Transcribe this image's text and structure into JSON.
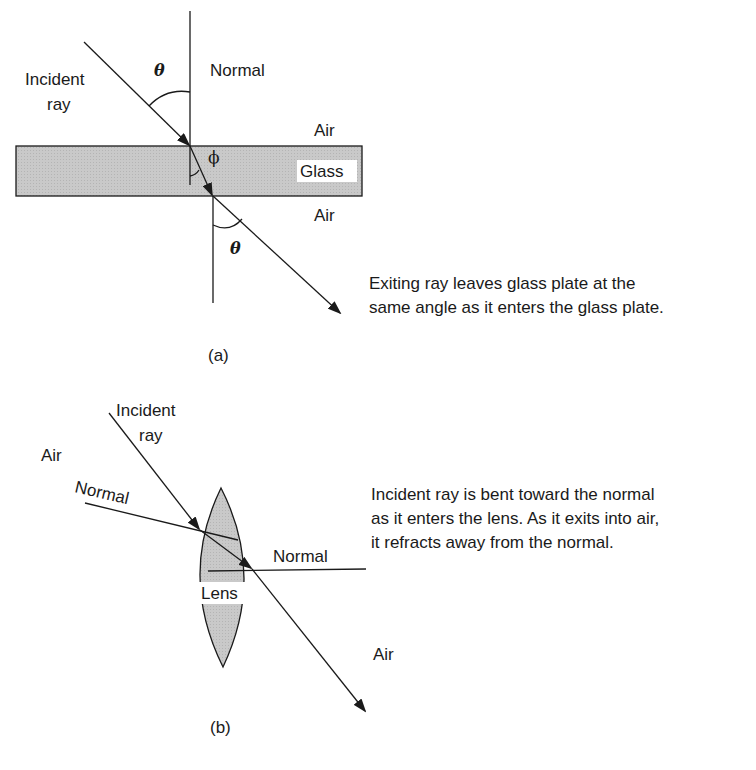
{
  "panel_a": {
    "caption": "(a)",
    "incident_label_line1": "Incident",
    "incident_label_line2": "ray",
    "normal_label": "Normal",
    "air_top_label": "Air",
    "glass_label": "Glass",
    "air_bottom_label": "Air",
    "angle_incident_symbol": "θ",
    "angle_refracted_symbol": "ϕ",
    "angle_exit_symbol": "θ",
    "description_line1": "Exiting ray leaves glass plate at the",
    "description_line2": "same angle as it enters the glass plate."
  },
  "panel_b": {
    "caption": "(b)",
    "incident_label_line1": "Incident",
    "incident_label_line2": "ray",
    "air_left_label": "Air",
    "normal_entry_label": "Normal",
    "normal_exit_label": "Normal",
    "lens_label": "Lens",
    "air_right_label": "Air",
    "description_line1": "Incident ray is bent toward the normal",
    "description_line2": "as it enters the lens.  As it exits into air,",
    "description_line3": "it refracts away from the normal."
  },
  "colors": {
    "medium_fill": "#c8c8c8",
    "stroke": "#1a1a1a"
  }
}
